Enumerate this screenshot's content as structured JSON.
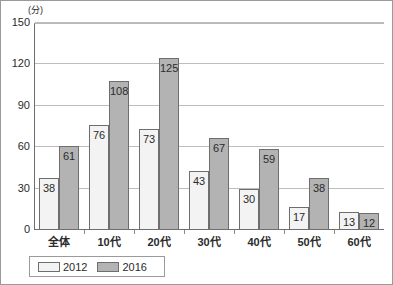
{
  "chart_data": {
    "type": "bar",
    "title": "",
    "subtitle": "",
    "unit_label": "(分)",
    "xlabel": "",
    "ylabel": "",
    "ylim": [
      0,
      150
    ],
    "yticks": [
      0,
      30,
      60,
      90,
      120,
      150
    ],
    "ytick_labels": [
      "0",
      "30",
      "60",
      "90",
      "120",
      "150"
    ],
    "grid": true,
    "legend_position": "bottom-left",
    "categories": [
      "全体",
      "10代",
      "20代",
      "30代",
      "40代",
      "50代",
      "60代"
    ],
    "series": [
      {
        "name": "2012",
        "color": "#f3f3f3",
        "values": [
          38,
          76,
          73,
          43,
          30,
          17,
          13
        ],
        "labels": [
          "38",
          "76",
          "73",
          "43",
          "30",
          "17",
          "13"
        ]
      },
      {
        "name": "2016",
        "color": "#b3b3b3",
        "values": [
          61,
          108,
          125,
          67,
          59,
          38,
          12
        ],
        "labels": [
          "61",
          "108",
          "125",
          "67",
          "59",
          "38",
          "12"
        ]
      }
    ]
  },
  "legend": {
    "items": [
      {
        "label": "2012",
        "swatch": "s2012"
      },
      {
        "label": "2016",
        "swatch": "s2016"
      }
    ]
  }
}
